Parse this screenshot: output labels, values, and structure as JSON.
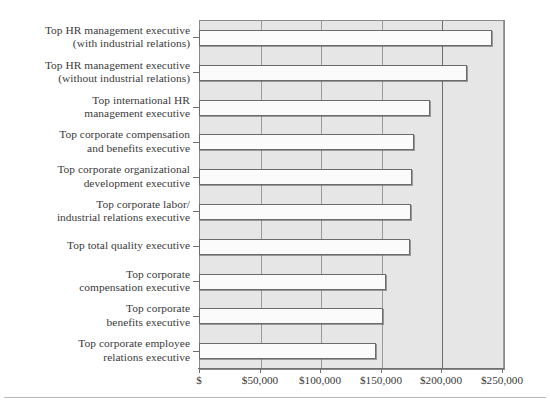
{
  "chart_data": {
    "type": "bar",
    "orientation": "horizontal",
    "title": "",
    "subtitle": "",
    "xlabel": "",
    "ylabel": "",
    "xlim": [
      0,
      251000
    ],
    "grid": true,
    "legend": null,
    "categories": [
      "Top HR management executive (with industrial relations)",
      "Top HR management executive (without industrial relations)",
      "Top international HR management executive",
      "Top corporate compensation and benefits executive",
      "Top corporate organizational development executive",
      "Top corporate labor/ industrial relations executive",
      "Top total quality executive",
      "Top corporate compensation executive",
      "Top corporate benefits executive",
      "Top corporate employee relations executive"
    ],
    "category_lines": [
      [
        "Top HR management executive",
        "(with industrial relations)"
      ],
      [
        "Top HR management executive",
        "(without industrial relations)"
      ],
      [
        "Top international HR",
        "management executive"
      ],
      [
        "Top corporate compensation",
        "and benefits executive"
      ],
      [
        "Top corporate organizational",
        "development executive"
      ],
      [
        "Top corporate labor/",
        "industrial relations executive"
      ],
      [
        "Top total quality executive"
      ],
      [
        "Top corporate",
        "compensation executive"
      ],
      [
        "Top corporate",
        "benefits executive"
      ],
      [
        "Top corporate employee",
        "relations executive"
      ]
    ],
    "values": [
      241500,
      220500,
      189500,
      176500,
      175000,
      174000,
      173500,
      153500,
      151500,
      145500
    ],
    "tick_values": [
      0,
      50000,
      100000,
      150000,
      200000,
      250000
    ],
    "tick_labels": [
      "$",
      "$50,000",
      "$100,000",
      "$150,000",
      "$200,000",
      "$250,000"
    ],
    "colors": {
      "plot_background": "#e6e6e6",
      "bar_fill": "#fbfbfb",
      "bar_border": "#6b6b6b",
      "gridline": "#9a9a9a",
      "gridline_major": "#6e6e6e",
      "axis": "#6f6f6f",
      "text": "#3a3a3a"
    }
  }
}
